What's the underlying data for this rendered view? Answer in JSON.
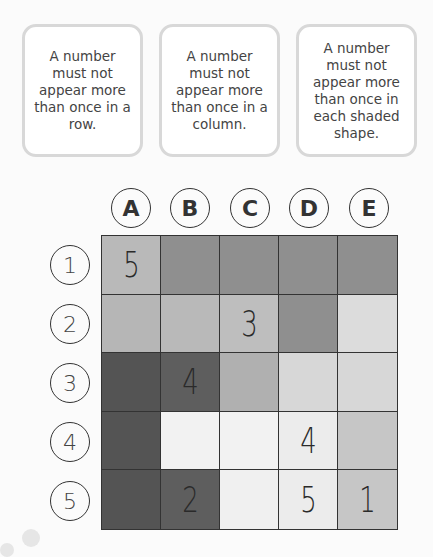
{
  "rules": [
    {
      "text": "A number must not appear more than once in a row."
    },
    {
      "text": "A number must not appear more than once in a column."
    },
    {
      "text": "A number must not appear more than once in each shaded shape."
    }
  ],
  "columns": [
    "A",
    "B",
    "C",
    "D",
    "E"
  ],
  "rows": [
    "1",
    "2",
    "3",
    "4",
    "5"
  ],
  "grid": {
    "values": [
      [
        "5",
        "",
        "",
        "",
        ""
      ],
      [
        "",
        "",
        "3",
        "",
        ""
      ],
      [
        "",
        "4",
        "",
        "",
        ""
      ],
      [
        "",
        "",
        "",
        "4",
        ""
      ],
      [
        "",
        "2",
        "",
        "5",
        "1"
      ]
    ],
    "shades": [
      [
        "#b9b9b9",
        "#8f8f8f",
        "#8f8f8f",
        "#8f8f8f",
        "#8f8f8f"
      ],
      [
        "#b6b6b6",
        "#b9b9b9",
        "#bebebe",
        "#8f8f8f",
        "#dcdcdc"
      ],
      [
        "#545454",
        "#5e5e5e",
        "#b0b0b0",
        "#d7d7d7",
        "#d7d7d7"
      ],
      [
        "#545454",
        "#f2f2f2",
        "#f2f2f2",
        "#ececec",
        "#c6c6c6"
      ],
      [
        "#545454",
        "#5e5e5e",
        "#f0f0f0",
        "#ececec",
        "#c6c6c6"
      ]
    ]
  }
}
